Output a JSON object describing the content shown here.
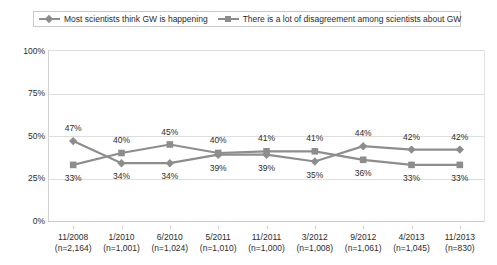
{
  "legend": {
    "entries": [
      {
        "label": "Most scientists think GW is happening",
        "marker": "diamond-marker-icon",
        "color": "#8d8d8d"
      },
      {
        "label": "There is a lot of disagreement among scientists about GW",
        "marker": "square-marker-icon",
        "color": "#8d8d8d"
      }
    ]
  },
  "chart_data": {
    "type": "line",
    "title": "",
    "xlabel": "",
    "ylabel": "",
    "ylim": [
      0,
      100
    ],
    "yticks": [
      "0%",
      "25%",
      "50%",
      "75%",
      "100%"
    ],
    "ytick_values": [
      0,
      25,
      50,
      75,
      100
    ],
    "grid": true,
    "legend_position": "top",
    "categories": [
      "11/2008",
      "1/2010",
      "6/2010",
      "5/2011",
      "11/2011",
      "3/2012",
      "9/2012",
      "4/2013",
      "11/2013"
    ],
    "category_sublabels": [
      "(n=2,164)",
      "(n=1,001)",
      "(n=1,024)",
      "(n=1,010)",
      "(n=1,000)",
      "(n=1,008)",
      "(n=1,061)",
      "(n=1,045)",
      "(n=830)"
    ],
    "series": [
      {
        "name": "Most scientists think GW is happening",
        "marker": "diamond",
        "color": "#8d8d8d",
        "values": [
          47,
          34,
          34,
          39,
          39,
          35,
          44,
          42,
          42
        ],
        "labels": [
          "47%",
          "34%",
          "34%",
          "39%",
          "39%",
          "35%",
          "44%",
          "42%",
          "42%"
        ],
        "label_position": [
          "above",
          "below",
          "below",
          "below",
          "below",
          "below",
          "above",
          "above",
          "above"
        ]
      },
      {
        "name": "There is a lot of disagreement among scientists about GW",
        "marker": "square",
        "color": "#8d8d8d",
        "values": [
          33,
          40,
          45,
          40,
          41,
          41,
          36,
          33,
          33
        ],
        "labels": [
          "33%",
          "40%",
          "45%",
          "40%",
          "41%",
          "41%",
          "36%",
          "33%",
          "33%"
        ],
        "label_position": [
          "below",
          "above",
          "above",
          "above",
          "above",
          "above",
          "below",
          "below",
          "below"
        ]
      }
    ]
  }
}
